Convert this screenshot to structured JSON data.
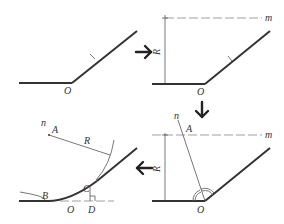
{
  "diagram": {
    "steps": [
      {
        "id": "step-1",
        "labels": {
          "vertex": "O",
          "tick": "l"
        }
      },
      {
        "id": "step-2",
        "labels": {
          "vertex": "O",
          "tick": "l",
          "parallel_line": "m",
          "radius": "R"
        }
      },
      {
        "id": "step-3",
        "labels": {
          "vertex": "O",
          "bisector": "n",
          "center": "A",
          "parallel_line": "m",
          "radius": "R"
        }
      },
      {
        "id": "step-4",
        "labels": {
          "bisector": "n",
          "center": "A",
          "radius": "R",
          "tangent_point_1": "B",
          "tangent_point_2": "C",
          "vertex": "O",
          "foot": "D"
        }
      }
    ],
    "arrows": [
      {
        "from": "step-1",
        "to": "step-2",
        "direction": "right",
        "glyph": "→"
      },
      {
        "from": "step-2",
        "to": "step-3",
        "direction": "down",
        "glyph": "↓"
      },
      {
        "from": "step-3",
        "to": "step-4",
        "direction": "left",
        "glyph": "←"
      }
    ],
    "colors": {
      "line": "#333333",
      "construction": "#888888",
      "background": "#ffffff"
    }
  }
}
